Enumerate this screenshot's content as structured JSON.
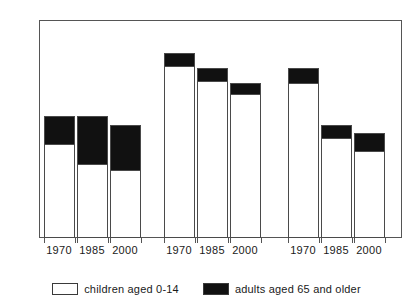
{
  "chart": {
    "title": "",
    "legend": {
      "children_label": "children aged 0-14",
      "adults_label": "adults aged 65 and older"
    },
    "axis": {
      "y_ticks": [
        "0",
        "20",
        "40",
        "60",
        "80",
        "100"
      ]
    },
    "groups": [
      {
        "name": "DEVELOPED COUNTRIES",
        "footnote": ""
      },
      {
        "name": "DEVELOPING COUNTRIES",
        "footnote": "**"
      },
      {
        "name": "CHINA",
        "footnote": ""
      }
    ],
    "year_labels": [
      "1970",
      "1985",
      "2000",
      "1970",
      "1985",
      "2000",
      "1970",
      "1985",
      "2000"
    ]
  },
  "chart_data": {
    "type": "bar",
    "title": "",
    "subtitle": "",
    "xlabel": "",
    "ylabel": "",
    "ylim": [
      0,
      100
    ],
    "yticks": [
      0,
      20,
      40,
      60,
      80,
      100
    ],
    "grid": false,
    "stacked": true,
    "legend_position": "bottom",
    "categories": [
      "1970",
      "1985",
      "2000",
      "1970",
      "1985",
      "2000",
      "1970",
      "1985",
      "2000"
    ],
    "groups": [
      "DEVELOPED COUNTRIES",
      "DEVELOPED COUNTRIES",
      "DEVELOPED COUNTRIES",
      "DEVELOPING COUNTRIES**",
      "DEVELOPING COUNTRIES**",
      "DEVELOPING COUNTRIES**",
      "CHINA",
      "CHINA",
      "CHINA"
    ],
    "series": [
      {
        "name": "children aged 0-14",
        "color": "#ffffff",
        "values": [
          43,
          34,
          31,
          79,
          72,
          66,
          71,
          46,
          40
        ]
      },
      {
        "name": "adults aged 65 and older",
        "color": "#111111",
        "values": [
          13,
          22,
          21,
          6,
          6,
          5,
          7,
          6,
          8
        ]
      }
    ],
    "totals": [
      56,
      56,
      52,
      85,
      78,
      71,
      78,
      52,
      48
    ]
  }
}
